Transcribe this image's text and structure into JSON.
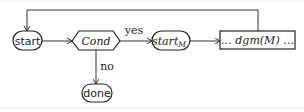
{
  "diagram": {
    "type": "flowchart",
    "nodes": {
      "start": {
        "label": "start",
        "shape": "rounded-pill"
      },
      "cond": {
        "label": "Cond",
        "shape": "hexagon"
      },
      "start_m": {
        "label": "start",
        "subscript": "M",
        "shape": "rounded-pill"
      },
      "dgm": {
        "label": "… dgm(M) …",
        "shape": "rectangle"
      },
      "done": {
        "label": "done",
        "shape": "rounded-pill"
      }
    },
    "edges": [
      {
        "from": "start",
        "to": "cond",
        "label": ""
      },
      {
        "from": "cond",
        "to": "start_m",
        "label": "yes"
      },
      {
        "from": "start_m",
        "to": "dgm",
        "label": ""
      },
      {
        "from": "dgm",
        "to": "start",
        "label": "",
        "route": "loop-over-top"
      },
      {
        "from": "cond",
        "to": "done",
        "label": "no"
      }
    ],
    "colors": {
      "stroke": "#222222",
      "background": "#ffffff"
    }
  }
}
